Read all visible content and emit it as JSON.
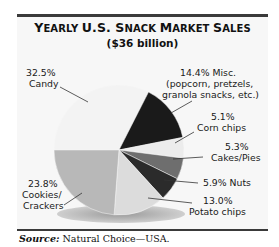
{
  "chart_data": {
    "type": "pie",
    "title": "Yearly U.S. Snack Market Sales",
    "subtitle": "($36 billion)",
    "slices": [
      {
        "label": "Candy",
        "value": 32.5,
        "color": "#f3f3f3"
      },
      {
        "label": "Misc. (popcorn, pretzels, granola snacks, etc.)",
        "value": 14.4,
        "color": "#1a1a1a"
      },
      {
        "label": "Corn chips",
        "value": 5.1,
        "color": "#ececec"
      },
      {
        "label": "Cakes/Pies",
        "value": 5.3,
        "color": "#6e6e6e"
      },
      {
        "label": "Nuts",
        "value": 5.9,
        "color": "#2b2b2b"
      },
      {
        "label": "Potato chips",
        "value": 13.0,
        "color": "#dcdcdc"
      },
      {
        "label": "Cookies/ Crackers",
        "value": 23.8,
        "color": "#b8b8b8"
      }
    ],
    "unit": "%",
    "total": "$36 billion"
  },
  "header": {
    "title_parts": [
      {
        "big": "Y",
        "small": "EARLY "
      },
      {
        "big": "U.S. ",
        "small": ""
      },
      {
        "big": "S",
        "small": "NACK "
      },
      {
        "big": "M",
        "small": "ARKET "
      },
      {
        "big": "S",
        "small": "ALES"
      }
    ],
    "subtitle": "($36 billion)"
  },
  "labels": {
    "candy_pct": "32.5%",
    "candy_name": "Candy",
    "misc_line1": "14.4% Misc.",
    "misc_line2": "(popcorn, pretzels,",
    "misc_line3": "granola snacks, etc.)",
    "corn_pct": "5.1%",
    "corn_name": "Corn chips",
    "cakes_pct": "5.3%",
    "cakes_name": "Cakes/Pies",
    "nuts": "5.9% Nuts",
    "potato_pct": "13.0%",
    "potato_name": "Potato chips",
    "cookies_pct": "23.8%",
    "cookies_name1": "Cookies/",
    "cookies_name2": "Crackers"
  },
  "footer": {
    "source_label": "Source:",
    "source_text": " Natural Choice—USA."
  }
}
